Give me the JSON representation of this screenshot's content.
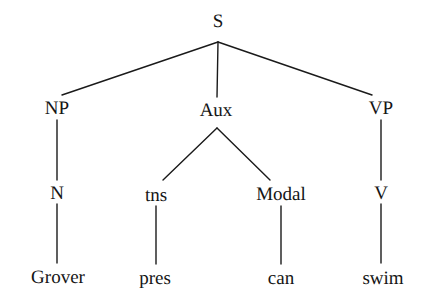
{
  "figure": {
    "type": "constituency-syntax-tree",
    "sentence": "Grover pres can swim",
    "background_color": "#ffffff",
    "line_color": "#1a1a1a",
    "text_color": "#151515"
  },
  "nodes": {
    "s": {
      "label": "S",
      "x": 218,
      "y": 21
    },
    "np": {
      "label": "NP",
      "x": 57,
      "y": 108
    },
    "aux": {
      "label": "Aux",
      "x": 216,
      "y": 110
    },
    "vp": {
      "label": "VP",
      "x": 381,
      "y": 108
    },
    "n": {
      "label": "N",
      "x": 57,
      "y": 193
    },
    "tns": {
      "label": "tns",
      "x": 156,
      "y": 195
    },
    "modal": {
      "label": "Modal",
      "x": 281,
      "y": 194
    },
    "v": {
      "label": "V",
      "x": 381,
      "y": 193
    },
    "grover": {
      "label": "Grover",
      "x": 58,
      "y": 277
    },
    "pres": {
      "label": "pres",
      "x": 155,
      "y": 278
    },
    "can": {
      "label": "can",
      "x": 281,
      "y": 278
    },
    "swim": {
      "label": "swim",
      "x": 383,
      "y": 278
    }
  },
  "edges": [
    {
      "from": "S",
      "to": "NP",
      "x1": 218,
      "y1": 42,
      "x2": 62,
      "y2": 95
    },
    {
      "from": "S",
      "to": "Aux",
      "x1": 218,
      "y1": 42,
      "x2": 217,
      "y2": 97
    },
    {
      "from": "S",
      "to": "VP",
      "x1": 218,
      "y1": 42,
      "x2": 372,
      "y2": 95
    },
    {
      "from": "NP",
      "to": "N",
      "x1": 57,
      "y1": 120,
      "x2": 57,
      "y2": 180
    },
    {
      "from": "Aux",
      "to": "tns",
      "x1": 217,
      "y1": 128,
      "x2": 163,
      "y2": 180
    },
    {
      "from": "Aux",
      "to": "Modal",
      "x1": 217,
      "y1": 128,
      "x2": 270,
      "y2": 180
    },
    {
      "from": "VP",
      "to": "V",
      "x1": 381,
      "y1": 120,
      "x2": 381,
      "y2": 180
    },
    {
      "from": "N",
      "to": "Grover",
      "x1": 57,
      "y1": 204,
      "x2": 57,
      "y2": 263
    },
    {
      "from": "tns",
      "to": "pres",
      "x1": 156,
      "y1": 206,
      "x2": 156,
      "y2": 264
    },
    {
      "from": "Modal",
      "to": "can",
      "x1": 281,
      "y1": 206,
      "x2": 281,
      "y2": 264
    },
    {
      "from": "V",
      "to": "swim",
      "x1": 381,
      "y1": 204,
      "x2": 381,
      "y2": 263
    }
  ]
}
